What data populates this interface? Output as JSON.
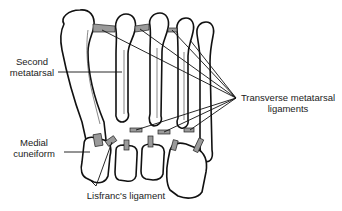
{
  "figure": {
    "type": "anatomical illustration",
    "labels": [
      {
        "id": "second-metatarsal",
        "lines": [
          "Second",
          "metatarsal"
        ]
      },
      {
        "id": "medial-cuneiform",
        "lines": [
          "Medial",
          "cuneiform"
        ]
      },
      {
        "id": "lisfranc-ligament",
        "lines": [
          "Lisfranc's ligament"
        ]
      },
      {
        "id": "transverse-metatarsal-ligaments",
        "lines": [
          "Transverse metatarsal",
          "ligaments"
        ]
      }
    ]
  }
}
